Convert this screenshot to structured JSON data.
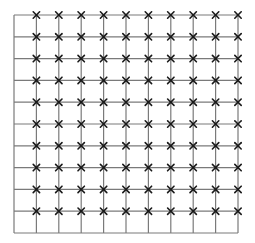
{
  "diagram": {
    "type": "lattice-grid",
    "grid": {
      "left": 14,
      "top": 15,
      "right": 238,
      "bottom": 233,
      "columns": 10,
      "rows": 10,
      "line_color": "#7a7a7a",
      "line_width": 1.2
    },
    "markers": {
      "glyph": "x",
      "color": "#1a1a1a",
      "size": 3.2,
      "rows_marked": [
        0,
        1,
        2,
        3,
        4,
        5,
        6,
        7,
        8,
        9
      ],
      "cols_marked": [
        1,
        2,
        3,
        4,
        5,
        6,
        7,
        8,
        9,
        10
      ],
      "note": "Markers on every vertical line except the leftmost, on every horizontal line except the bottom"
    }
  }
}
